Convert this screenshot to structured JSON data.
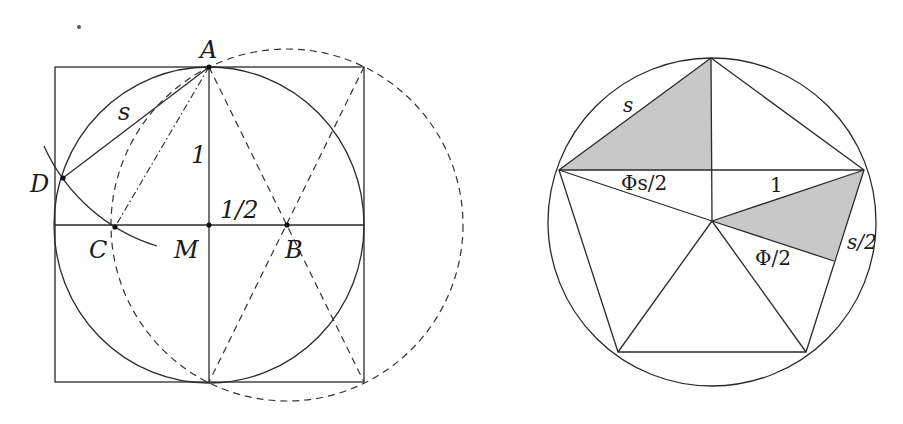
{
  "left_figure": {
    "labels": {
      "A": "A",
      "B": "B",
      "C": "C",
      "D": "D",
      "M": "M",
      "s": "s",
      "one": "1",
      "half": "1/2"
    }
  },
  "right_figure": {
    "labels": {
      "s": "s",
      "phi_s_half": "Φs/2",
      "one": "1",
      "s_half": "s/2",
      "phi_half": "Φ/2"
    },
    "shade_color": "#c8c8c8"
  }
}
